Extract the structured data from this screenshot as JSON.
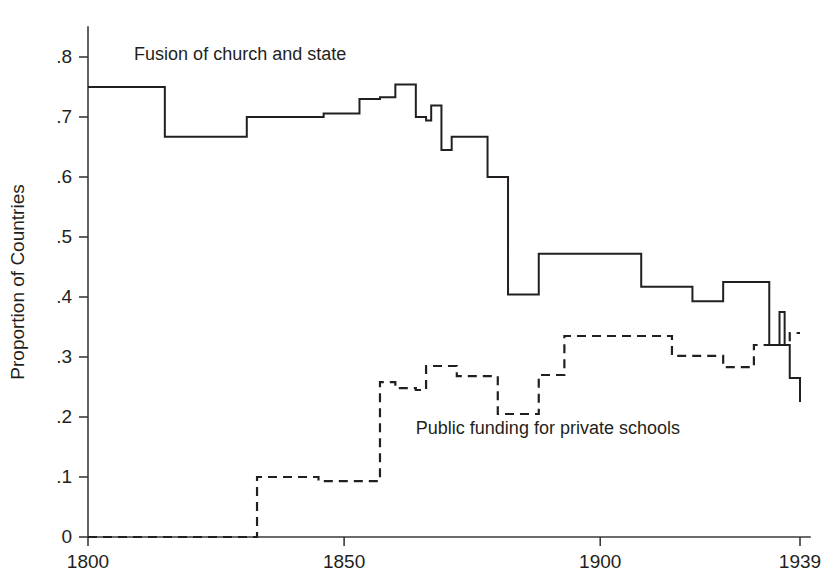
{
  "chart_data": {
    "type": "line",
    "title": "",
    "subtitle": "",
    "xlabel": "",
    "ylabel": "Proportion of Countries",
    "xlim": [
      1800,
      1939
    ],
    "ylim": [
      0,
      0.85
    ],
    "grid": false,
    "legend_position": "inline-annotation",
    "x_ticks": [
      1800,
      1850,
      1900,
      1939
    ],
    "x_tick_labels": [
      "1800",
      "1850",
      "1900",
      "1939"
    ],
    "y_ticks": [
      0,
      0.1,
      0.2,
      0.3,
      0.4,
      0.5,
      0.6,
      0.7,
      0.8
    ],
    "y_tick_labels": [
      "0",
      ".1",
      ".2",
      ".3",
      ".4",
      ".5",
      ".6",
      ".7",
      ".8"
    ],
    "interpolation": "step-post",
    "series": [
      {
        "name": "Fusion of church and state",
        "style": "solid",
        "color": "#231f20",
        "annotation": "Fusion of church and state",
        "annotation_x": 1809,
        "annotation_y": 0.795,
        "x": [
          1800,
          1815,
          1831,
          1846,
          1853,
          1857,
          1860,
          1864,
          1866,
          1867,
          1869,
          1871,
          1873,
          1876,
          1878,
          1880,
          1882,
          1884,
          1888,
          1900,
          1908,
          1915,
          1918,
          1921,
          1924,
          1930,
          1933,
          1935,
          1936,
          1937,
          1939
        ],
        "y": [
          0.75,
          0.667,
          0.7,
          0.706,
          0.73,
          0.733,
          0.754,
          0.7,
          0.694,
          0.719,
          0.645,
          0.667,
          0.667,
          0.667,
          0.6,
          0.6,
          0.404,
          0.404,
          0.472,
          0.472,
          0.417,
          0.417,
          0.393,
          0.393,
          0.425,
          0.425,
          0.32,
          0.375,
          0.32,
          0.265,
          0.225
        ]
      },
      {
        "name": "Public funding for private schools",
        "style": "dashed",
        "color": "#231f20",
        "annotation": "Public funding for private schools",
        "annotation_x": 1864,
        "annotation_y": 0.172,
        "x": [
          1800,
          1833,
          1845,
          1853,
          1857,
          1860,
          1864,
          1866,
          1869,
          1872,
          1876,
          1880,
          1884,
          1888,
          1893,
          1900,
          1914,
          1921,
          1924,
          1930,
          1934,
          1937,
          1939
        ],
        "y": [
          0.0,
          0.1,
          0.093,
          0.093,
          0.258,
          0.248,
          0.245,
          0.285,
          0.285,
          0.268,
          0.268,
          0.205,
          0.205,
          0.27,
          0.335,
          0.335,
          0.302,
          0.302,
          0.283,
          0.32,
          0.32,
          0.34,
          0.34
        ]
      }
    ]
  },
  "geometry": {
    "plot_left": 88,
    "plot_right": 800,
    "plot_bottom": 537,
    "y_zero_px": 537,
    "y_scale_px_per_unit": 600,
    "x_axis_label_y": 560,
    "y_axis_top": 27
  }
}
